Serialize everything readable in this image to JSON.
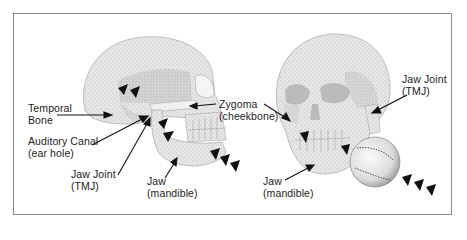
{
  "figure": {
    "left_skull": {
      "view": "lateral",
      "labels": [
        {
          "id": "temporal-bone",
          "line1": "Temporal",
          "line2": "Bone"
        },
        {
          "id": "auditory-canal",
          "line1": "Auditory Canal",
          "line2": "(ear hole)"
        },
        {
          "id": "jaw-joint",
          "line1": "Jaw Joint",
          "line2": "(TMJ)"
        },
        {
          "id": "jaw",
          "line1": "Jaw",
          "line2": "(mandible)"
        },
        {
          "id": "zygoma",
          "line1": "Zygoma",
          "line2": "(cheekbone)"
        }
      ]
    },
    "right_skull": {
      "view": "three-quarter front",
      "labels": [
        {
          "id": "jaw-joint",
          "line1": "Jaw Joint",
          "line2": "(TMJ)"
        },
        {
          "id": "jaw",
          "line1": "Jaw",
          "line2": "(mandible)"
        }
      ],
      "impact_object": "baseball"
    },
    "colors": {
      "border": "#8a8a8a",
      "bone": "#e2e2e2",
      "bone_shade": "#bdbdbd",
      "arrow": "#111111",
      "text": "#222222"
    }
  }
}
